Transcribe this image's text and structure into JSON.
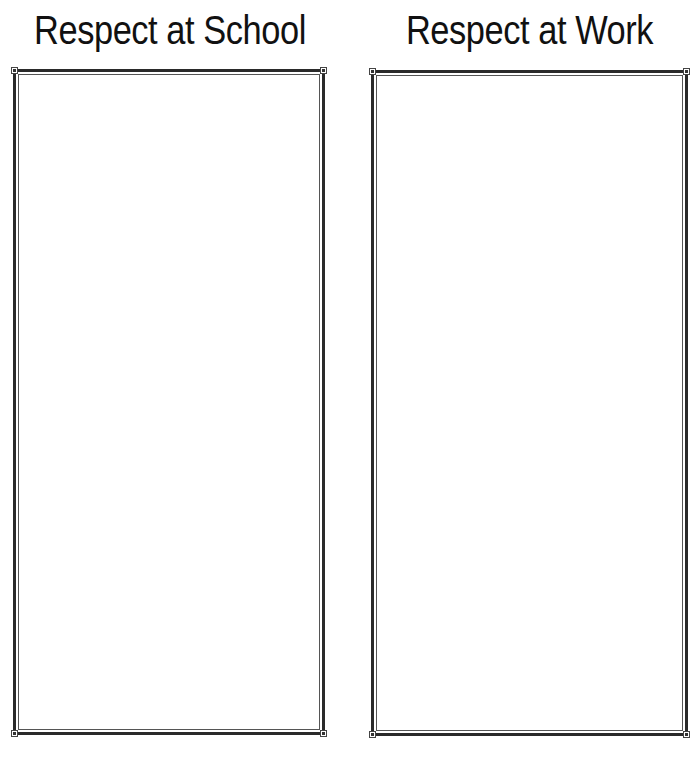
{
  "worksheet": {
    "columns": [
      {
        "heading": "Respect at School",
        "frame": "empty-writing-box"
      },
      {
        "heading": "Respect at Work",
        "frame": "empty-writing-box"
      }
    ]
  },
  "colors": {
    "text": "#111111",
    "border": "#2a2a2a",
    "background": "#ffffff"
  }
}
